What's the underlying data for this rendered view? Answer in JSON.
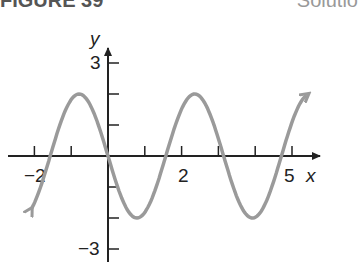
{
  "header": {
    "left": "FIGURE 39",
    "right": "Solutio"
  },
  "chart_data": {
    "type": "line",
    "title": "",
    "function": "y = -2 sin(2x)",
    "xlabel": "x",
    "ylabel": "y",
    "xlim": [
      -2.7,
      5.9
    ],
    "ylim": [
      -3.2,
      3.9
    ],
    "x_tick_values": [
      -2,
      -1,
      0,
      1,
      2,
      3,
      4,
      5
    ],
    "x_tick_labels": [
      "-2",
      "",
      "",
      "",
      "2",
      "",
      "",
      "5"
    ],
    "y_tick_values": [
      3,
      2,
      1,
      -1,
      -2,
      -3
    ],
    "y_tick_labels": [
      "3",
      "",
      "",
      "",
      "",
      "-3"
    ],
    "grid": false,
    "series": [
      {
        "name": "curve",
        "color": "#9a9a9a",
        "x": [
          -2.1,
          -1.5,
          -0.785,
          0,
          0.785,
          1.571,
          2.356,
          3.142,
          3.927,
          4.712,
          5.4
        ],
        "y": [
          -1.74,
          -0.28,
          2,
          0,
          -2,
          0,
          2,
          0,
          -2,
          0,
          1.96
        ]
      }
    ]
  }
}
